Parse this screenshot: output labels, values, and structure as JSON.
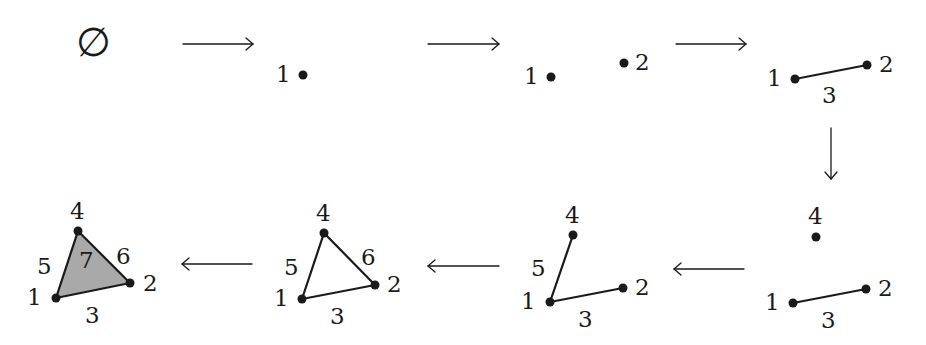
{
  "diagram": {
    "empty_set_symbol": "∅",
    "stages": [
      {
        "id": "s0",
        "cells": [],
        "label": "∅"
      },
      {
        "id": "s1",
        "vertices": [
          "1"
        ]
      },
      {
        "id": "s2",
        "vertices": [
          "1",
          "2"
        ]
      },
      {
        "id": "s3",
        "vertices": [
          "1",
          "2"
        ],
        "edges": [
          {
            "label": "3",
            "from": "1",
            "to": "2"
          }
        ]
      },
      {
        "id": "s4",
        "vertices": [
          "1",
          "2",
          "4"
        ],
        "edges": [
          {
            "label": "3",
            "from": "1",
            "to": "2"
          }
        ]
      },
      {
        "id": "s5",
        "vertices": [
          "1",
          "2",
          "4"
        ],
        "edges": [
          {
            "label": "3",
            "from": "1",
            "to": "2"
          },
          {
            "label": "5",
            "from": "1",
            "to": "4"
          }
        ]
      },
      {
        "id": "s6",
        "vertices": [
          "1",
          "2",
          "4"
        ],
        "edges": [
          {
            "label": "3",
            "from": "1",
            "to": "2"
          },
          {
            "label": "5",
            "from": "1",
            "to": "4"
          },
          {
            "label": "6",
            "from": "2",
            "to": "4"
          }
        ]
      },
      {
        "id": "s7",
        "vertices": [
          "1",
          "2",
          "4"
        ],
        "edges": [
          {
            "label": "3",
            "from": "1",
            "to": "2"
          },
          {
            "label": "5",
            "from": "1",
            "to": "4"
          },
          {
            "label": "6",
            "from": "2",
            "to": "4"
          }
        ],
        "faces": [
          {
            "label": "7",
            "vertices": [
              "1",
              "2",
              "4"
            ],
            "fill": "#a9a9a9"
          }
        ]
      }
    ],
    "labels": {
      "v1": "1",
      "v2": "2",
      "e3": "3",
      "v4": "4",
      "e5": "5",
      "e6": "6",
      "f7": "7"
    },
    "arrows": [
      {
        "from": "s0",
        "to": "s1",
        "direction": "right"
      },
      {
        "from": "s1",
        "to": "s2",
        "direction": "right"
      },
      {
        "from": "s2",
        "to": "s3",
        "direction": "right"
      },
      {
        "from": "s3",
        "to": "s4",
        "direction": "down"
      },
      {
        "from": "s4",
        "to": "s5",
        "direction": "left"
      },
      {
        "from": "s5",
        "to": "s6",
        "direction": "left"
      },
      {
        "from": "s6",
        "to": "s7",
        "direction": "left"
      }
    ],
    "colors": {
      "ink": "#1a1a1a",
      "face_fill": "#a9a9a9",
      "background": "#ffffff"
    }
  }
}
